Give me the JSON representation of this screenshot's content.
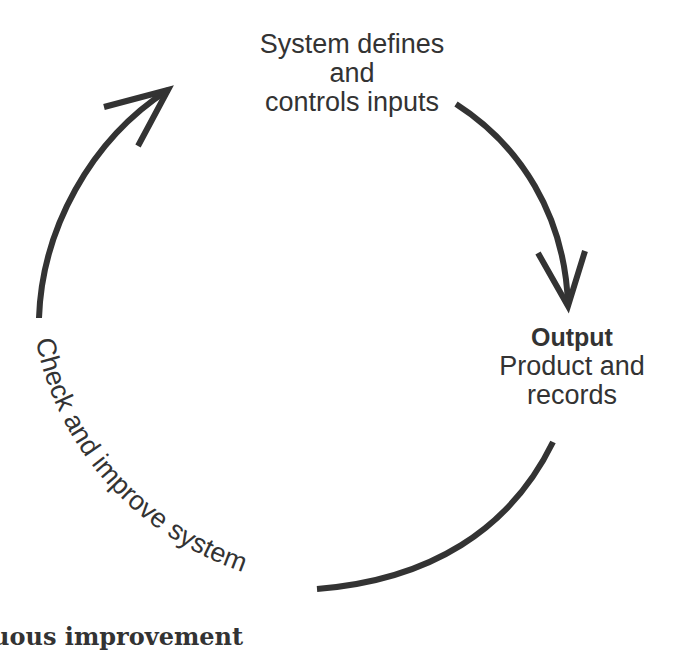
{
  "diagram": {
    "type": "cycle",
    "nodes": [
      {
        "id": "inputs",
        "lines": [
          "System defines",
          "and",
          "controls inputs"
        ]
      },
      {
        "id": "output",
        "title": "Output",
        "lines": [
          "Product and",
          "records"
        ]
      },
      {
        "id": "check",
        "label": "Check and improve system"
      }
    ],
    "edges": [
      {
        "from": "inputs",
        "to": "output",
        "arrow": true
      },
      {
        "from": "output",
        "to": "check",
        "arrow": false
      },
      {
        "from": "check",
        "to": "inputs",
        "arrow": true
      }
    ],
    "colors": {
      "stroke": "#333333",
      "text": "#333333",
      "background": "#ffffff"
    }
  },
  "caption": "uous improvement"
}
